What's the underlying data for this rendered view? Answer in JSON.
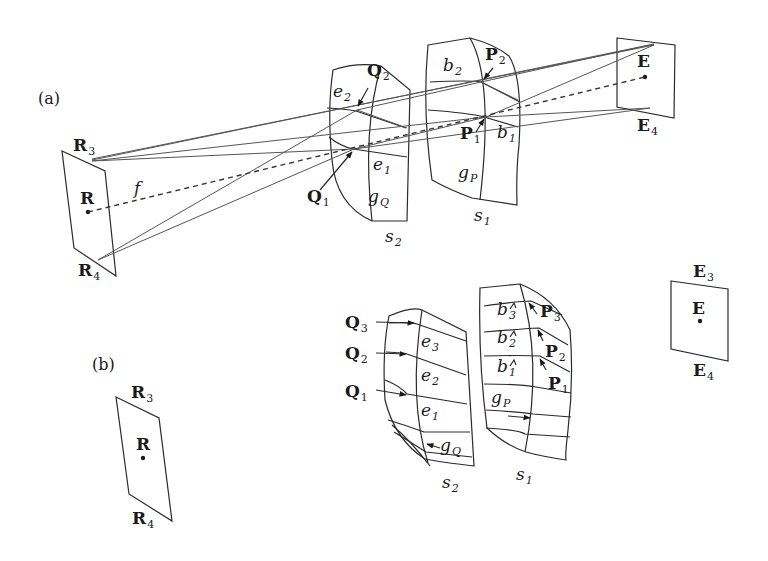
{
  "panel_a": {
    "label": "(a)",
    "receiver": {
      "name": "R",
      "corner_top": "R",
      "corner_top_sub": "3",
      "corner_bottom": "R",
      "corner_bottom_sub": "4"
    },
    "emitter": {
      "name": "E",
      "corner_bottom": "E",
      "corner_bottom_sub": "4"
    },
    "focal_label": "f",
    "surface_s2": {
      "name": "s",
      "sub": "2",
      "points": [
        {
          "name": "Q",
          "sub": "2"
        },
        {
          "name": "Q",
          "sub": "1"
        }
      ],
      "edges": [
        {
          "name": "e",
          "sub": "2"
        },
        {
          "name": "e",
          "sub": "1"
        }
      ],
      "grid": {
        "name": "g",
        "sub": "Q"
      }
    },
    "surface_s1": {
      "name": "s",
      "sub": "1",
      "points": [
        {
          "name": "P",
          "sub": "2"
        },
        {
          "name": "P",
          "sub": "1"
        }
      ],
      "edges": [
        {
          "name": "b",
          "sub": "2"
        },
        {
          "name": "b",
          "sub": "1"
        }
      ],
      "grid": {
        "name": "g",
        "sub": "P"
      }
    }
  },
  "panel_b": {
    "label": "(b)",
    "receiver": {
      "name": "R",
      "corner_top": "R",
      "corner_top_sub": "3",
      "corner_bottom": "R",
      "corner_bottom_sub": "4"
    },
    "emitter": {
      "name": "E",
      "corner_top": "E",
      "corner_top_sub": "3",
      "corner_bottom": "E",
      "corner_bottom_sub": "4"
    },
    "surface_s2": {
      "name": "s",
      "sub": "2",
      "points": [
        {
          "name": "Q",
          "sub": "3"
        },
        {
          "name": "Q",
          "sub": "2"
        },
        {
          "name": "Q",
          "sub": "1"
        }
      ],
      "edges": [
        {
          "name": "e",
          "sub": "3"
        },
        {
          "name": "e",
          "sub": "2"
        },
        {
          "name": "e",
          "sub": "1"
        }
      ],
      "grid": {
        "name": "g",
        "sub": "Q"
      }
    },
    "surface_s1": {
      "name": "s",
      "sub": "1",
      "points": [
        {
          "name": "P",
          "sub": "3"
        },
        {
          "name": "P",
          "sub": "2"
        },
        {
          "name": "P",
          "sub": "1"
        }
      ],
      "edges": [
        {
          "name": "b",
          "sub": "3"
        },
        {
          "name": "b",
          "sub": "2"
        },
        {
          "name": "b",
          "sub": "1"
        }
      ],
      "grid": {
        "name": "g",
        "sub": "P"
      }
    }
  }
}
